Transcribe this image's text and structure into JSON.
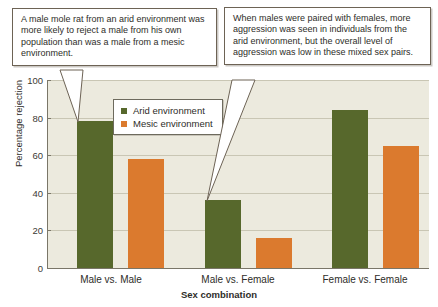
{
  "chart_data": {
    "type": "bar",
    "title": "",
    "xlabel": "Sex combination",
    "ylabel": "Percentage rejection",
    "categories": [
      "Male vs. Male",
      "Male vs. Female",
      "Female vs. Female"
    ],
    "series": [
      {
        "name": "Arid environment",
        "color": "#57682c",
        "values": [
          78,
          36,
          84
        ]
      },
      {
        "name": "Mesic environment",
        "color": "#db7a2e",
        "values": [
          58,
          16,
          65
        ]
      }
    ],
    "ylim": [
      0,
      100
    ],
    "yticks": [
      0,
      20,
      40,
      60,
      80,
      100
    ],
    "ytick_labels": [
      "0",
      "20",
      "40",
      "60",
      "80",
      "100"
    ],
    "grid": true,
    "legend_position": "upper center",
    "plot_background": "#eceade",
    "gridline_color": "#c9c6b4"
  },
  "legend": {
    "items": [
      {
        "label": "Arid environment",
        "swatch": "arid-swatch"
      },
      {
        "label": "Mesic environment",
        "swatch": "mesic-swatch"
      }
    ]
  },
  "annotations": [
    {
      "id": "callout-left",
      "text": "A male mole rat from an arid environment was more likely to reject a male from his own population than was a male from a mesic environment.",
      "points_to": "Male vs. Male / Arid environment bar"
    },
    {
      "id": "callout-right",
      "text": "When males were paired with females, more aggression was seen in individuals from the arid environment, but the overall level of aggression was low in these mixed sex pairs.",
      "points_to": "Male vs. Female / Arid environment bar"
    }
  ],
  "axes": {
    "y_title": "Percentage rejection",
    "x_title": "Sex combination",
    "y_tick_labels": [
      "100",
      "80",
      "60",
      "40",
      "20",
      "0"
    ],
    "x_tick_labels": [
      "Male vs. Male",
      "Male vs. Female",
      "Female vs. Female"
    ]
  }
}
